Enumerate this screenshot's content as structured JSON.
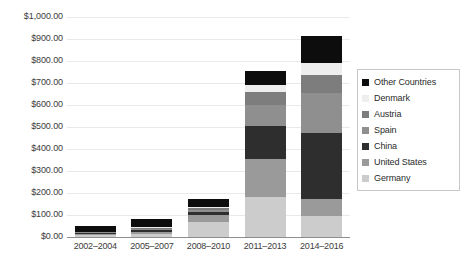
{
  "chart_data": {
    "type": "bar",
    "stacked": true,
    "title": "",
    "xlabel": "",
    "ylabel": "",
    "ylim": [
      0,
      1000
    ],
    "ytick_step": 100,
    "grid": true,
    "legend_position": "right",
    "categories": [
      "2002–2004",
      "2005–2007",
      "2008–2010",
      "2011–2013",
      "2014–2016"
    ],
    "ytick_labels": [
      "$1,000.00",
      "$900.00",
      "$800.00",
      "$700.00",
      "$600.00",
      "$500.00",
      "$400.00",
      "$300.00",
      "$200.00",
      "$100.00",
      "$0.00"
    ],
    "series": [
      {
        "name": "Germany",
        "color": "#cccccc",
        "values": [
          8,
          14,
          68,
          180,
          95
        ]
      },
      {
        "name": "United States",
        "color": "#9a9a9a",
        "values": [
          6,
          10,
          30,
          175,
          80
        ]
      },
      {
        "name": "China",
        "color": "#2e2e2e",
        "values": [
          4,
          8,
          14,
          150,
          300
        ]
      },
      {
        "name": "Spain",
        "color": "#8f8f8f",
        "values": [
          3,
          5,
          10,
          95,
          180
        ]
      },
      {
        "name": "Austria",
        "color": "#7d7d7d",
        "values": [
          2,
          4,
          8,
          60,
          80
        ]
      },
      {
        "name": "Denmark",
        "color": "#eeeeee",
        "values": [
          2,
          3,
          6,
          30,
          55
        ]
      },
      {
        "name": "Other Countries",
        "color": "#0d0d0d",
        "values": [
          27,
          36,
          39,
          65,
          125
        ]
      }
    ],
    "totals": [
      52,
      80,
      175,
      855,
      915
    ]
  },
  "legend": {
    "items": [
      {
        "label": "Other Countries",
        "color": "#0d0d0d"
      },
      {
        "label": "Denmark",
        "color": "#eeeeee"
      },
      {
        "label": "Austria",
        "color": "#7d7d7d"
      },
      {
        "label": "Spain",
        "color": "#8f8f8f"
      },
      {
        "label": "China",
        "color": "#2e2e2e"
      },
      {
        "label": "United States",
        "color": "#9a9a9a"
      },
      {
        "label": "Germany",
        "color": "#cccccc"
      }
    ]
  }
}
